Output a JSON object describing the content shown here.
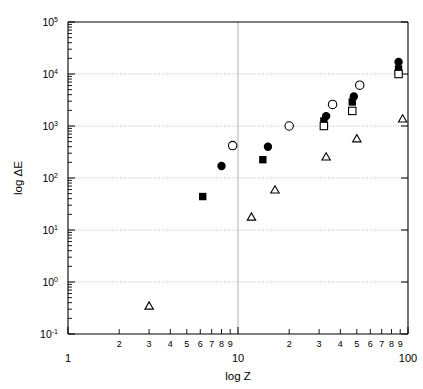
{
  "chart_data": {
    "type": "scatter",
    "title": "",
    "xlabel": "log Z",
    "ylabel": "log ΔE",
    "xscale": "log",
    "yscale": "log",
    "xlim": [
      1,
      100
    ],
    "ylim": [
      0.1,
      100000
    ],
    "grid": true,
    "legend": "none",
    "x_major_ticks": [
      "1",
      "10",
      "100"
    ],
    "x_minor_ticks": [
      "2",
      "3",
      "4",
      "5",
      "6",
      "7",
      "8",
      "9",
      "2",
      "3",
      "4",
      "5",
      "6",
      "7",
      "8",
      "9"
    ],
    "y_tick_labels": [
      "10-1",
      "100",
      "101",
      "102",
      "103",
      "104",
      "105"
    ],
    "y_tick_mantissas": [
      "10",
      "10",
      "10",
      "10",
      "10",
      "10",
      "10"
    ],
    "y_tick_exponents": [
      "-1",
      "0",
      "1",
      "2",
      "3",
      "4",
      "5"
    ],
    "series": [
      {
        "name": "filled-circle",
        "marker": "filled-circle",
        "color": "#000000",
        "points": [
          {
            "x": 8.0,
            "y": 170
          },
          {
            "x": 15.0,
            "y": 400
          },
          {
            "x": 33.0,
            "y": 1550
          },
          {
            "x": 48.0,
            "y": 3700
          },
          {
            "x": 88.0,
            "y": 17000
          }
        ]
      },
      {
        "name": "filled-square",
        "marker": "filled-square",
        "color": "#000000",
        "points": [
          {
            "x": 6.2,
            "y": 44
          },
          {
            "x": 14.0,
            "y": 225
          },
          {
            "x": 32.0,
            "y": 1250
          },
          {
            "x": 47.0,
            "y": 2900
          },
          {
            "x": 88.0,
            "y": 12500
          }
        ]
      },
      {
        "name": "open-circle",
        "marker": "open-circle",
        "color": "#000000",
        "points": [
          {
            "x": 9.3,
            "y": 420
          },
          {
            "x": 20.0,
            "y": 1000
          },
          {
            "x": 36.0,
            "y": 2600
          },
          {
            "x": 52.0,
            "y": 6100
          }
        ]
      },
      {
        "name": "open-square",
        "marker": "open-square",
        "color": "#000000",
        "points": [
          {
            "x": 32.0,
            "y": 1000
          },
          {
            "x": 47.0,
            "y": 1950
          },
          {
            "x": 88.0,
            "y": 10000
          }
        ]
      },
      {
        "name": "open-triangle",
        "marker": "open-triangle",
        "color": "#000000",
        "points": [
          {
            "x": 3.0,
            "y": 0.34
          },
          {
            "x": 12.0,
            "y": 17.5
          },
          {
            "x": 16.5,
            "y": 58
          },
          {
            "x": 33.0,
            "y": 250
          },
          {
            "x": 50.0,
            "y": 560
          },
          {
            "x": 93.0,
            "y": 1350
          }
        ]
      }
    ]
  },
  "axes": {
    "x_title": "log Z",
    "y_title": "log ΔE"
  }
}
